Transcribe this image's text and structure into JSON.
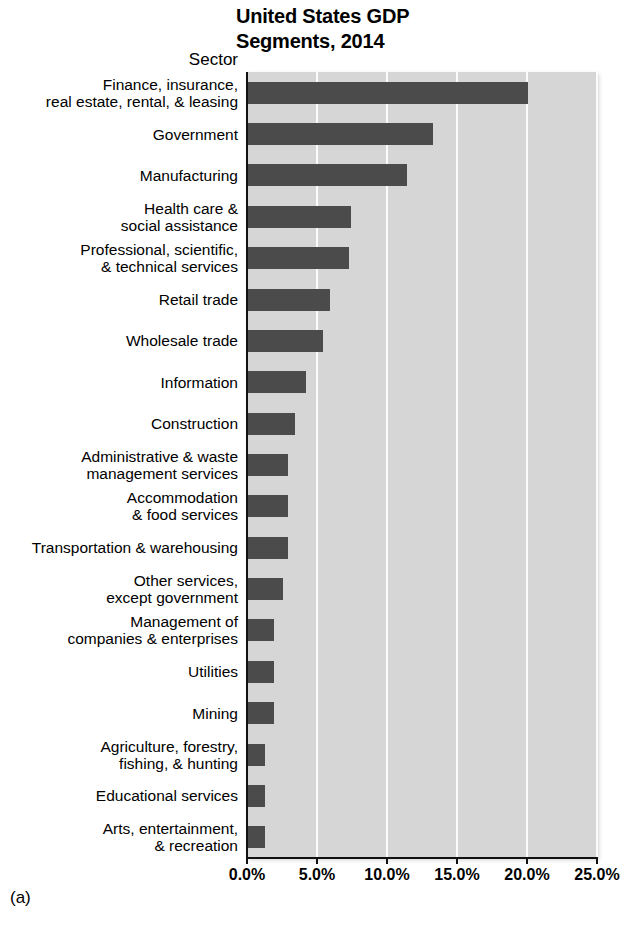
{
  "chart_data": {
    "type": "bar",
    "orientation": "horizontal",
    "title_lines": [
      "United States GDP",
      "Segments, 2014"
    ],
    "axis_header": "Sector",
    "xlabel": "",
    "ylabel": "Sector",
    "xlim": [
      0,
      25
    ],
    "xticks": [
      0,
      5,
      10,
      15,
      20,
      25
    ],
    "xtick_labels": [
      "0.0%",
      "5.0%",
      "10.0%",
      "15.0%",
      "20.0%",
      "25.0%"
    ],
    "grid": true,
    "legend": null,
    "units": "percent of GDP",
    "categories": [
      "Finance, insurance, real estate, rental, & leasing",
      "Government",
      "Manufacturing",
      "Health care & social assistance",
      "Professional, scientific, & technical services",
      "Retail trade",
      "Wholesale trade",
      "Information",
      "Construction",
      "Administrative & waste management services",
      "Accommodation & food services",
      "Transportation & warehousing",
      "Other services, except government",
      "Management of companies & enterprises",
      "Utilities",
      "Mining",
      "Agriculture, forestry, fishing, & hunting",
      "Educational services",
      "Arts, entertainment, & recreation"
    ],
    "category_lines": [
      [
        "Finance, insurance,",
        "real estate, rental, & leasing"
      ],
      [
        "Government"
      ],
      [
        "Manufacturing"
      ],
      [
        "Health care &",
        "social assistance"
      ],
      [
        "Professional, scientific,",
        "& technical services"
      ],
      [
        "Retail trade"
      ],
      [
        "Wholesale trade"
      ],
      [
        "Information"
      ],
      [
        "Construction"
      ],
      [
        "Administrative & waste",
        "management services"
      ],
      [
        "Accommodation",
        "& food services"
      ],
      [
        "Transportation & warehousing"
      ],
      [
        "Other services,",
        "except government"
      ],
      [
        "Management of",
        "companies & enterprises"
      ],
      [
        "Utilities"
      ],
      [
        "Mining"
      ],
      [
        "Agriculture, forestry,",
        "fishing, & hunting"
      ],
      [
        "Educational services"
      ],
      [
        "Arts, entertainment,",
        "& recreation"
      ]
    ],
    "values": [
      20.1,
      13.3,
      11.4,
      7.4,
      7.3,
      5.9,
      5.4,
      4.2,
      3.4,
      2.9,
      2.9,
      2.9,
      2.6,
      1.9,
      1.9,
      1.9,
      1.3,
      1.3,
      1.3
    ],
    "bar_color": "#4b4b4b",
    "plot_background": "#d6d6d6",
    "gridline_color": "#fbfbfb"
  },
  "caption": "(a)"
}
